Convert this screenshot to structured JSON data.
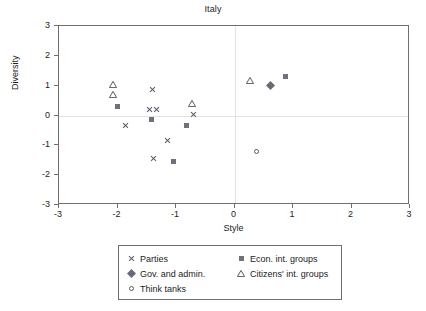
{
  "chart_data": {
    "type": "scatter",
    "title": "Italy",
    "xlabel": "Style",
    "ylabel": "Diversity",
    "xlim": [
      -3,
      3
    ],
    "ylim": [
      -3,
      3
    ],
    "xticks": [
      "-3",
      "-2",
      "-1",
      "0",
      "1",
      "2",
      "3"
    ],
    "yticks": [
      "3",
      "2",
      "1",
      "0",
      "-1",
      "-2",
      "-3"
    ],
    "xtick_values": [
      -3,
      -2,
      -1,
      0,
      1,
      2,
      3
    ],
    "ytick_values": [
      3,
      2,
      1,
      0,
      -1,
      -2,
      -3
    ],
    "grid": "zero-lines-only",
    "legend_position": "below-axes",
    "series": [
      {
        "name": "Parties",
        "marker": "cross-x",
        "color": "#5a5a66",
        "points": [
          {
            "x": -1.87,
            "y": -0.35
          },
          {
            "x": -1.4,
            "y": 0.86
          },
          {
            "x": -1.45,
            "y": 0.21
          },
          {
            "x": -1.33,
            "y": 0.21
          },
          {
            "x": -1.15,
            "y": -0.84
          },
          {
            "x": -1.38,
            "y": -1.45
          },
          {
            "x": -0.7,
            "y": 0.02
          }
        ]
      },
      {
        "name": "Gov. and admin.",
        "marker": "filled-diamond",
        "color": "#6a6a76",
        "points": [
          {
            "x": 0.62,
            "y": 1.01
          }
        ]
      },
      {
        "name": "Think tanks",
        "marker": "open-circle",
        "color": "#5a5a66",
        "points": [
          {
            "x": 0.37,
            "y": -1.19
          }
        ]
      },
      {
        "name": "Econ. int. groups",
        "marker": "filled-square",
        "color": "#70707c",
        "points": [
          {
            "x": -2.0,
            "y": 0.3
          },
          {
            "x": -1.42,
            "y": -0.12
          },
          {
            "x": -1.05,
            "y": -1.53
          },
          {
            "x": -0.82,
            "y": -0.35
          },
          {
            "x": 0.87,
            "y": 1.3
          }
        ]
      },
      {
        "name": "Citizens' int. groups",
        "marker": "open-triangle",
        "color": "#5a5a66",
        "points": [
          {
            "x": -2.07,
            "y": 1.03
          },
          {
            "x": -2.07,
            "y": 0.7
          },
          {
            "x": -0.73,
            "y": 0.41
          },
          {
            "x": 0.27,
            "y": 1.17
          }
        ]
      }
    ]
  },
  "legend": {
    "entries": [
      {
        "label": "Parties",
        "marker": "cross-x"
      },
      {
        "label": "Econ. int. groups",
        "marker": "filled-square"
      },
      {
        "label": "Gov. and admin.",
        "marker": "filled-diamond"
      },
      {
        "label": "Citizens' int. groups",
        "marker": "open-triangle"
      },
      {
        "label": "Think tanks",
        "marker": "open-circle"
      }
    ]
  },
  "colors": {
    "frame": "#6e6e6e",
    "gridline": "#e2e2e2",
    "text": "#1c1c1c",
    "marker": "#5a5a66"
  }
}
